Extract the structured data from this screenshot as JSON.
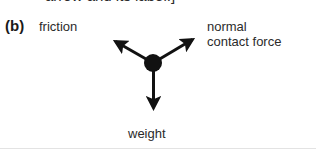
{
  "figure": {
    "caption_remnant": "arrow and its label.]",
    "part_label": "(b)",
    "stroke_color": "#111111",
    "text_color": "#2b2b2b",
    "background_color": "#ffffff"
  },
  "diagram": {
    "type": "free-body-diagram",
    "origin": {
      "x": 153,
      "y": 63
    },
    "dot_radius": 9,
    "forces": [
      {
        "name": "friction",
        "label": "friction",
        "tip": {
          "x": 110,
          "y": 38
        },
        "direction": "up-left"
      },
      {
        "name": "normal-contact-force",
        "label_line1": "normal",
        "label_line2": "contact force",
        "tip": {
          "x": 198,
          "y": 35
        },
        "direction": "up-right"
      },
      {
        "name": "weight",
        "label": "weight",
        "tip": {
          "x": 154,
          "y": 121
        },
        "direction": "down"
      }
    ]
  }
}
